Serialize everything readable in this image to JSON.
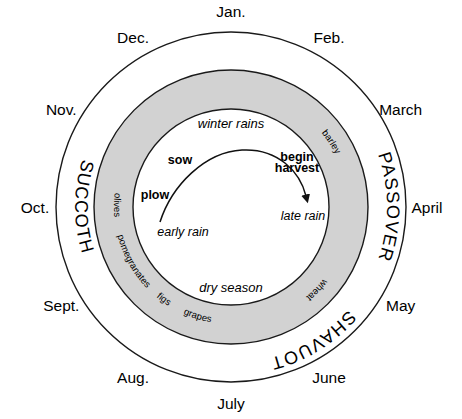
{
  "diagram": {
    "geometry": {
      "cx": 231,
      "cy": 207,
      "outer_radius": 175,
      "band_outer_radius": 137,
      "band_inner_radius": 98,
      "month_label_radius": 196,
      "festival_radius": 156,
      "crop_radius": 117,
      "season_radius": 86
    },
    "colors": {
      "band_fill": "#d2d2d2",
      "stroke": "#1a1a1a",
      "background": "#ffffff",
      "text": "#000000"
    },
    "months": [
      {
        "label": "Jan.",
        "angle": -90
      },
      {
        "label": "Feb.",
        "angle": -60
      },
      {
        "label": "March",
        "angle": -30
      },
      {
        "label": "April",
        "angle": 0
      },
      {
        "label": "May",
        "angle": 30
      },
      {
        "label": "June",
        "angle": 60
      },
      {
        "label": "July",
        "angle": 90
      },
      {
        "label": "Aug.",
        "angle": 120
      },
      {
        "label": "Sept.",
        "angle": 150
      },
      {
        "label": "Oct.",
        "angle": 180
      },
      {
        "label": "Nov.",
        "angle": 210
      },
      {
        "label": "Dec.",
        "angle": 240
      }
    ],
    "festivals": [
      {
        "label": "SUCCOTH",
        "start_angle": 207,
        "end_angle": 153,
        "direction": "ccw"
      },
      {
        "label": "PASSOVER",
        "start_angle": -27,
        "end_angle": 27,
        "direction": "cw"
      },
      {
        "label": "SHAVUOT",
        "start_angle": 35,
        "end_angle": 82,
        "direction": "cw"
      }
    ],
    "crops": [
      {
        "label": "barley",
        "start_angle": -52,
        "end_angle": -14
      },
      {
        "label": "wheat",
        "start_angle": 30,
        "end_angle": 58
      },
      {
        "label": "olives",
        "start_angle": 190,
        "end_angle": 172
      },
      {
        "label": "pomegranates",
        "start_angle": 166,
        "end_angle": 136
      },
      {
        "label": "figs",
        "start_angle": 133,
        "end_angle": 119
      },
      {
        "label": "grapes",
        "start_angle": 116,
        "end_angle": 98
      }
    ],
    "seasons": [
      {
        "label": "winter rains",
        "x": 231,
        "y": 128
      },
      {
        "label": "dry season",
        "x": 231,
        "y": 292
      }
    ],
    "inner_labels": [
      {
        "label": "early rain",
        "x": 183,
        "y": 236,
        "style": "italic",
        "anchor": "middle"
      },
      {
        "label": "late rain",
        "x": 303,
        "y": 220,
        "style": "italic",
        "anchor": "middle"
      },
      {
        "label": "plow",
        "x": 155,
        "y": 199,
        "style": "bold",
        "anchor": "middle"
      },
      {
        "label": "sow",
        "x": 180,
        "y": 164,
        "style": "bold",
        "anchor": "middle"
      },
      {
        "label": "begin",
        "x": 297,
        "y": 161,
        "style": "bold",
        "anchor": "middle"
      },
      {
        "label": "harvest",
        "x": 297,
        "y": 172,
        "style": "bold",
        "anchor": "middle"
      }
    ],
    "arrow": {
      "name": "growing-season-arrow",
      "path": "M 160,222 C 172,185 205,152 242,150 C 278,148 300,172 306,196",
      "tip_x": 308,
      "tip_y": 203
    }
  }
}
